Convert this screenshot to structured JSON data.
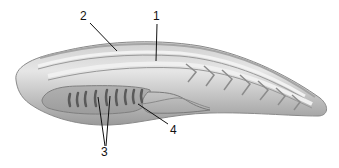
{
  "figure": {
    "colors": {
      "body_light": "#e2e2e2",
      "body_mid": "#b8b8b8",
      "body_dark": "#8a8a8a",
      "outline": "#7a7a7a",
      "gill_slit": "#555555",
      "leader_line": "#111111",
      "background": "#ffffff"
    },
    "labels": [
      {
        "id": "1",
        "text": "1"
      },
      {
        "id": "2",
        "text": "2"
      },
      {
        "id": "3",
        "text": "3"
      },
      {
        "id": "4",
        "text": "4"
      }
    ]
  }
}
